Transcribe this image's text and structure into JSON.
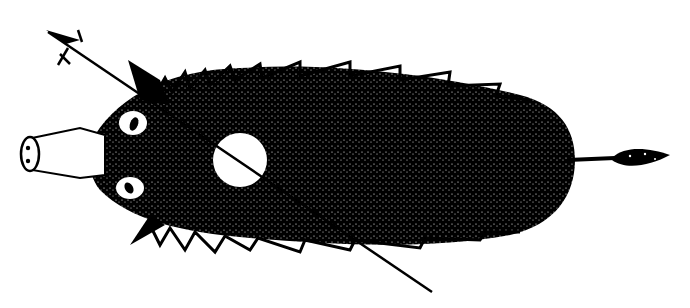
{
  "illustration": {
    "subject": "pig viewed from above",
    "colors": {
      "ink": "#000000",
      "paper": "#ffffff"
    },
    "elements": {
      "body": "hairy pig body",
      "snout": "snout with two nostrils",
      "ears": [
        "upper ear",
        "lower ear"
      ],
      "eyes": [
        "upper eye",
        "lower eye"
      ],
      "target_circle": "white circle with diagonal line",
      "arrow": "arrow line with fletched end crossing body",
      "tail": "tufted tail"
    }
  }
}
